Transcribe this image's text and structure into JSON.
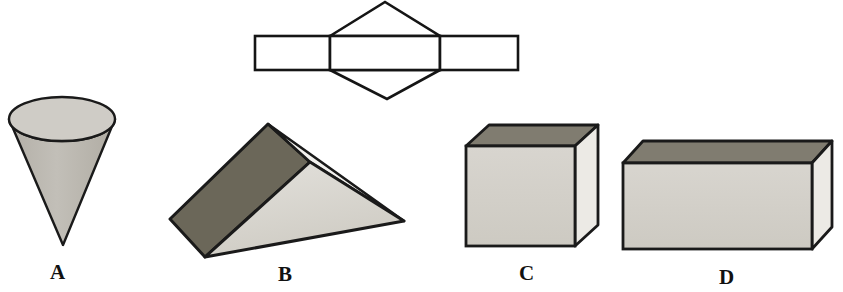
{
  "figure": {
    "background_color": "#ffffff",
    "outline_color": "#111111",
    "palette": {
      "net_stroke": "#151515",
      "cone_top_fill": "#cfccc6",
      "cone_body_fill": "#bdb9b1",
      "prism_dark_face": "#6b6759",
      "prism_light_face": "#d7d4cd",
      "prism_sliver_face": "#f2f1ee",
      "box_top_face": "#807c70",
      "box_front_face": "#d2cfc8",
      "box_side_face": "#eceae5"
    },
    "net": {
      "name": "triangular-prism-net",
      "description": "Net made of three rectangles in a row with a triangle above and a triangle below the middle rectangle",
      "left_rect": {
        "x": 255,
        "y": 36,
        "width": 75,
        "height": 34
      },
      "middle_rect": {
        "x": 330,
        "y": 36,
        "width": 110,
        "height": 34
      },
      "right_rect": {
        "x": 440,
        "y": 36,
        "width": 78,
        "height": 34
      },
      "top_triangle_apex": {
        "x": 385,
        "y": 2
      },
      "bottom_triangle_apex": {
        "x": 387,
        "y": 99
      }
    },
    "shapes": [
      {
        "id": "A",
        "label": "A",
        "name": "cone",
        "label_x": 50,
        "label_y": 262,
        "geometry": {
          "ellipse_cx": 62,
          "ellipse_cy": 119,
          "ellipse_rx": 53,
          "ellipse_ry": 22,
          "apex_x": 63,
          "apex_y": 245
        }
      },
      {
        "id": "B",
        "label": "B",
        "name": "triangular-prism",
        "label_x": 278,
        "label_y": 264,
        "geometry": {
          "ridge_back": {
            "x": 268,
            "y": 124
          },
          "ridge_front": {
            "x": 310,
            "y": 162
          },
          "left_back": {
            "x": 170,
            "y": 219
          },
          "left_front": {
            "x": 205,
            "y": 257
          },
          "right_apex": {
            "x": 404,
            "y": 221
          }
        }
      },
      {
        "id": "C",
        "label": "C",
        "name": "cube",
        "label_x": 519,
        "label_y": 263,
        "geometry": {
          "front": {
            "x": 466,
            "y": 146,
            "width": 109,
            "height": 100
          },
          "depth_dx": 23,
          "depth_dy": -21
        }
      },
      {
        "id": "D",
        "label": "D",
        "name": "rectangular-prism",
        "label_x": 719,
        "label_y": 267,
        "geometry": {
          "front": {
            "x": 623,
            "y": 163,
            "width": 189,
            "height": 86
          },
          "depth_dx": 20,
          "depth_dy": -22
        }
      }
    ]
  }
}
